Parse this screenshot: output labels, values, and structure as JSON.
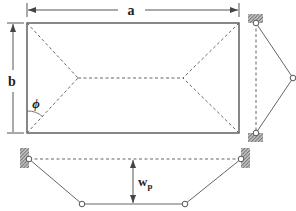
{
  "labels": {
    "a": "a",
    "b": "b",
    "phi": "ϕ",
    "wp_main": "w",
    "wp_sub": "p"
  },
  "colors": {
    "line": "#555555",
    "dash": "#6a6a6a",
    "text": "#222222",
    "support_hatch": "#777777"
  }
}
